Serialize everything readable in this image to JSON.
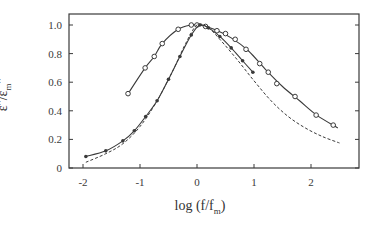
{
  "chart_data": {
    "type": "line",
    "title": "",
    "xlabel": "log (f/f_m)",
    "ylabel": "ε''/ε_m''",
    "xlim": [
      -2.25,
      2.85
    ],
    "ylim": [
      0,
      1.05
    ],
    "xticks": [
      -2,
      -1,
      0,
      1,
      2
    ],
    "xtick_labels": [
      "-2",
      "-1",
      "0",
      "1",
      "2"
    ],
    "yticks": [
      0,
      0.2,
      0.4,
      0.6,
      0.8,
      1.0
    ],
    "ytick_labels": [
      "0",
      "0.2",
      "0.4",
      "0.6",
      "0.8",
      "1.0"
    ],
    "grid": false,
    "legend": null,
    "series": [
      {
        "name": "open circles (broad relaxation)",
        "marker": "open-circle",
        "line": "solid",
        "x": [
          -1.21,
          -0.91,
          -0.75,
          -0.61,
          -0.33,
          -0.1,
          0.0,
          0.15,
          0.35,
          0.5,
          0.67,
          0.86,
          1.1,
          1.25,
          1.4,
          1.72,
          2.09,
          2.39
        ],
        "y": [
          0.52,
          0.7,
          0.78,
          0.87,
          0.97,
          1.0,
          1.0,
          0.99,
          0.96,
          0.94,
          0.9,
          0.83,
          0.73,
          0.67,
          0.59,
          0.5,
          0.37,
          0.3
        ],
        "line_x": [
          -1.21,
          -0.91,
          -0.75,
          -0.61,
          -0.33,
          -0.1,
          0.05,
          0.3,
          0.6,
          0.9,
          1.2,
          1.5,
          1.8,
          2.1,
          2.47
        ],
        "line_y": [
          0.52,
          0.7,
          0.78,
          0.87,
          0.97,
          1.0,
          1.0,
          0.97,
          0.91,
          0.82,
          0.69,
          0.57,
          0.47,
          0.37,
          0.28
        ]
      },
      {
        "name": "filled points (narrow relaxation)",
        "marker": "filled-circle",
        "line": "solid",
        "x": [
          -1.95,
          -1.6,
          -1.3,
          -1.1,
          -0.9,
          -0.7,
          -0.5,
          -0.3,
          -0.1,
          0.05,
          0.2,
          0.4,
          0.6,
          0.8,
          0.98
        ],
        "y": [
          0.08,
          0.12,
          0.19,
          0.26,
          0.36,
          0.47,
          0.62,
          0.78,
          0.93,
          1.0,
          0.98,
          0.92,
          0.84,
          0.75,
          0.67
        ]
      },
      {
        "name": "dashed fit curve",
        "marker": "none",
        "line": "dashed",
        "x": [
          -1.95,
          -1.6,
          -1.3,
          -1.0,
          -0.7,
          -0.4,
          -0.2,
          0.0,
          0.2,
          0.4,
          0.7,
          1.0,
          1.3,
          1.6,
          1.9,
          2.2,
          2.5
        ],
        "y": [
          0.04,
          0.1,
          0.17,
          0.29,
          0.47,
          0.7,
          0.87,
          1.0,
          0.98,
          0.9,
          0.76,
          0.61,
          0.47,
          0.36,
          0.28,
          0.22,
          0.175
        ]
      }
    ]
  },
  "axes": {
    "x_title_main": "log (f/f",
    "x_title_sub": "m",
    "x_title_end": ")",
    "y_title_main": "ε''/ε",
    "y_title_sub": "m",
    "y_title_end": "''"
  },
  "style": {
    "ink": "#3a3a3a",
    "background": "#ffffff"
  }
}
